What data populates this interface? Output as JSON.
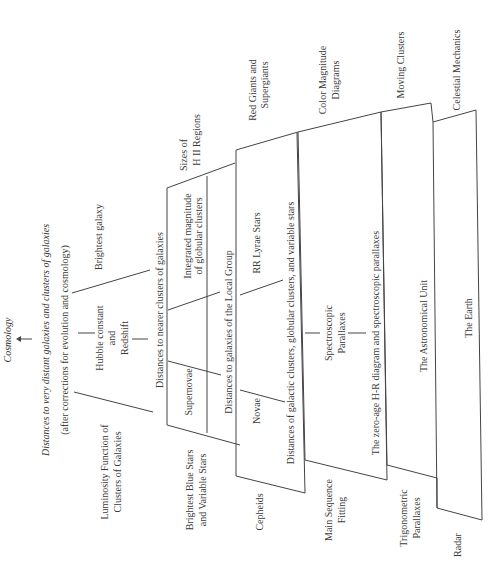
{
  "diagram": {
    "orientation": "rotated 90 degrees counter-clockwise",
    "top": {
      "cosmology": "Cosmology",
      "very_distant": "Distances to very distant galaxies and clusters of galaxies",
      "corrections": "(after corrections for evolution and cosmology)"
    },
    "galaxy_level": {
      "luminosity_line1": "Luminosity Function of",
      "luminosity_line2": "Clusters of Galaxies",
      "hubble_line1": "Hubble constant",
      "hubble_line2": "and",
      "hubble_line3": "Redshift",
      "brightest_galaxy": "Brightest galaxy"
    },
    "boxes": [
      {
        "id": "nearer-galaxies",
        "header": "Distances to nearer clusters of galaxies",
        "footer": "Distances to galaxies of the Local Group",
        "left_label_line1": "Brightest Blue Stars",
        "left_label_line2": "and Variable Stars",
        "right_label_line1": "Sizes of",
        "right_label_line2": "H II Regions",
        "cells": [
          "Supernovae",
          "Integrated magnitude",
          "of globular clusters"
        ]
      },
      {
        "id": "galactic-clusters",
        "header": "Distances of galactic clusters, globular clusters, and variable stars",
        "left_label": "Cepheids",
        "right_label_line1": "Red Giants and",
        "right_label_line2": "Supergiants",
        "cells": [
          "Novae",
          "RR Lyrae Stars"
        ]
      },
      {
        "id": "zero-age-hr",
        "header": "The zero-age H-R diagram and spectroscopic parallaxes",
        "left_label_line1": "Main Sequence",
        "left_label_line2": "Fitting",
        "right_label_line1": "Color Magnitude",
        "right_label_line2": "Diagrams",
        "middle_line1": "Spectroscopic",
        "middle_line2": "Parallaxes"
      },
      {
        "id": "astronomical-unit",
        "header": "The Astronomical Unit",
        "left_label_line1": "Trigonometric",
        "left_label_line2": "Parallaxes",
        "right_label": "Moving Clusters"
      },
      {
        "id": "earth",
        "header": "The Earth",
        "left_label": "Radar",
        "right_label": "Celestial Mechanics"
      }
    ]
  }
}
